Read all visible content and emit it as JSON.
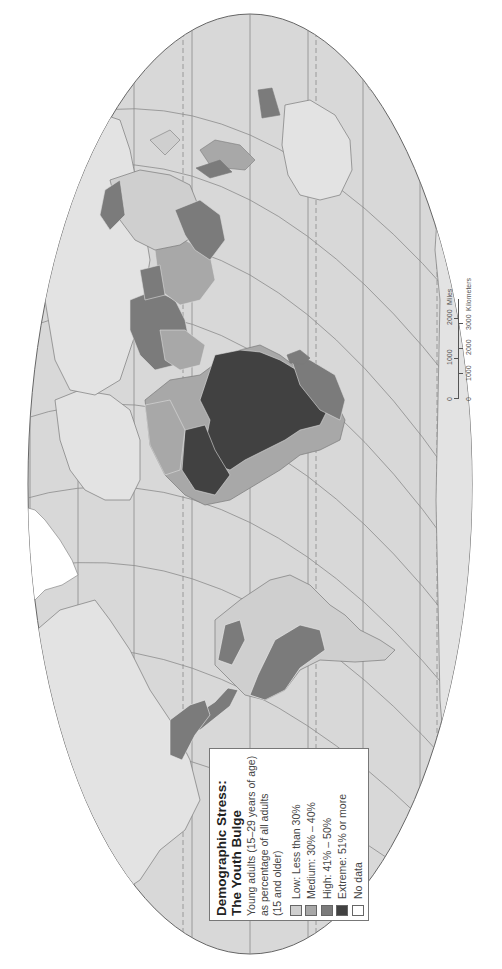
{
  "map": {
    "orientation": "rotated 90 degrees counter-clockwise (north to the left)",
    "colors": {
      "ocean": "#d8d8d8",
      "land_base": "#e3e3e3",
      "outline": "#7a7a7a",
      "graticule": "#8c8c8c",
      "low": "#cfcfcf",
      "medium": "#a8a8a8",
      "high": "#7b7b7b",
      "extreme": "#414141",
      "no_data": "#ffffff"
    }
  },
  "legend": {
    "title_line1": "Demographic Stress:",
    "title_line2": "The Youth Bulge",
    "subtitle_line1": "Young adults (15–29 years of age)",
    "subtitle_line2": "as percentage of all adults",
    "subtitle_line3": "(15 and older)",
    "items": [
      {
        "label": "Low:  Less than 30%",
        "color": "#cfcfcf"
      },
      {
        "label": "Medium:  30% – 40%",
        "color": "#a8a8a8"
      },
      {
        "label": "High:  41% – 50%",
        "color": "#7b7b7b"
      },
      {
        "label": "Extreme:  51% or more",
        "color": "#414141"
      },
      {
        "label": "No data",
        "color": "#ffffff"
      }
    ]
  },
  "scale_bar": {
    "miles": {
      "ticks": [
        "0",
        "1000",
        "2000"
      ],
      "unit": "Miles"
    },
    "kilometers": {
      "ticks": [
        "0",
        "1000",
        "2000",
        "3000"
      ],
      "unit": "Kilometers"
    }
  }
}
